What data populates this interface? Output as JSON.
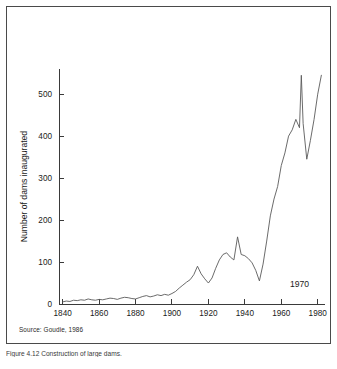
{
  "figure": {
    "source_note": "Source: Goudie, 1986",
    "caption": "Figure 4.12   Construction of large dams."
  },
  "chart_data": {
    "type": "line",
    "title": "",
    "xlabel": "",
    "ylabel": "Number of dams inaugurated",
    "xlim": [
      1838,
      1984
    ],
    "ylim": [
      0,
      560
    ],
    "xticks": [
      1840,
      1860,
      1880,
      1900,
      1920,
      1940,
      1960,
      1980
    ],
    "xtick_labels": [
      "1840",
      "1860",
      "1880",
      "1900",
      "1920",
      "1940",
      "1960",
      "1980"
    ],
    "yticks": [
      0,
      100,
      200,
      300,
      400,
      500
    ],
    "ytick_labels": [
      "0",
      "100",
      "200",
      "300",
      "400",
      "500"
    ],
    "grid": false,
    "legend": "none",
    "annotations": [
      {
        "text": "1970",
        "x": 1970,
        "y": 40
      }
    ],
    "series": [
      {
        "name": "Dams inaugurated",
        "color": "#5a5a5a",
        "x": [
          1840,
          1842,
          1844,
          1846,
          1848,
          1850,
          1852,
          1854,
          1856,
          1858,
          1860,
          1862,
          1864,
          1866,
          1868,
          1870,
          1872,
          1874,
          1876,
          1878,
          1880,
          1882,
          1884,
          1886,
          1888,
          1890,
          1892,
          1894,
          1896,
          1898,
          1900,
          1902,
          1904,
          1906,
          1908,
          1910,
          1912,
          1914,
          1916,
          1918,
          1920,
          1922,
          1924,
          1926,
          1928,
          1930,
          1932,
          1934,
          1936,
          1938,
          1940,
          1942,
          1944,
          1946,
          1948,
          1950,
          1952,
          1954,
          1956,
          1958,
          1960,
          1962,
          1964,
          1966,
          1968,
          1970,
          1971,
          1972,
          1974,
          1976,
          1978,
          1980,
          1982
        ],
        "values": [
          5,
          7,
          6,
          9,
          8,
          10,
          9,
          12,
          10,
          9,
          11,
          10,
          12,
          14,
          13,
          11,
          14,
          16,
          15,
          13,
          12,
          15,
          18,
          20,
          17,
          19,
          22,
          20,
          23,
          21,
          25,
          30,
          38,
          45,
          52,
          58,
          70,
          90,
          72,
          60,
          50,
          62,
          85,
          105,
          118,
          122,
          112,
          105,
          160,
          118,
          115,
          108,
          98,
          80,
          55,
          95,
          150,
          210,
          250,
          280,
          330,
          360,
          400,
          415,
          440,
          420,
          545,
          430,
          345,
          390,
          440,
          500,
          545
        ]
      }
    ]
  }
}
